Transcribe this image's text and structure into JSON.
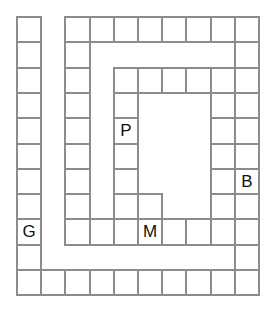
{
  "board": {
    "title": "Spiral path game board",
    "origin": [
      16,
      16
    ],
    "cell_size": [
      24.2,
      25.3
    ],
    "columns": 10,
    "rows": 11,
    "line_color": "#8c8c8c",
    "cells": [
      {
        "col": 0,
        "row": 0
      },
      {
        "col": 0,
        "row": 1
      },
      {
        "col": 0,
        "row": 2
      },
      {
        "col": 0,
        "row": 3
      },
      {
        "col": 0,
        "row": 4
      },
      {
        "col": 0,
        "row": 5
      },
      {
        "col": 0,
        "row": 6
      },
      {
        "col": 0,
        "row": 7
      },
      {
        "col": 0,
        "row": 8,
        "label": "G"
      },
      {
        "col": 0,
        "row": 9
      },
      {
        "col": 0,
        "row": 10
      },
      {
        "col": 1,
        "row": 10
      },
      {
        "col": 2,
        "row": 10
      },
      {
        "col": 3,
        "row": 10
      },
      {
        "col": 4,
        "row": 10
      },
      {
        "col": 5,
        "row": 10
      },
      {
        "col": 6,
        "row": 10
      },
      {
        "col": 7,
        "row": 10
      },
      {
        "col": 8,
        "row": 10
      },
      {
        "col": 9,
        "row": 10
      },
      {
        "col": 9,
        "row": 9
      },
      {
        "col": 9,
        "row": 8
      },
      {
        "col": 9,
        "row": 7
      },
      {
        "col": 9,
        "row": 6,
        "label": "B"
      },
      {
        "col": 9,
        "row": 5
      },
      {
        "col": 9,
        "row": 4
      },
      {
        "col": 9,
        "row": 3
      },
      {
        "col": 9,
        "row": 2
      },
      {
        "col": 9,
        "row": 1
      },
      {
        "col": 9,
        "row": 0
      },
      {
        "col": 8,
        "row": 0
      },
      {
        "col": 7,
        "row": 0
      },
      {
        "col": 6,
        "row": 0
      },
      {
        "col": 5,
        "row": 0
      },
      {
        "col": 4,
        "row": 0
      },
      {
        "col": 3,
        "row": 0
      },
      {
        "col": 2,
        "row": 0
      },
      {
        "col": 2,
        "row": 1
      },
      {
        "col": 2,
        "row": 2
      },
      {
        "col": 2,
        "row": 3
      },
      {
        "col": 2,
        "row": 4
      },
      {
        "col": 2,
        "row": 5
      },
      {
        "col": 2,
        "row": 6
      },
      {
        "col": 2,
        "row": 7
      },
      {
        "col": 2,
        "row": 8
      },
      {
        "col": 3,
        "row": 8
      },
      {
        "col": 4,
        "row": 8
      },
      {
        "col": 5,
        "row": 8,
        "label": "M"
      },
      {
        "col": 6,
        "row": 8
      },
      {
        "col": 7,
        "row": 8
      },
      {
        "col": 8,
        "row": 8
      },
      {
        "col": 8,
        "row": 7
      },
      {
        "col": 8,
        "row": 6
      },
      {
        "col": 8,
        "row": 5
      },
      {
        "col": 8,
        "row": 4
      },
      {
        "col": 8,
        "row": 3
      },
      {
        "col": 8,
        "row": 2
      },
      {
        "col": 7,
        "row": 2
      },
      {
        "col": 6,
        "row": 2
      },
      {
        "col": 5,
        "row": 2
      },
      {
        "col": 4,
        "row": 2
      },
      {
        "col": 4,
        "row": 3
      },
      {
        "col": 4,
        "row": 4,
        "label": "P"
      },
      {
        "col": 4,
        "row": 5
      },
      {
        "col": 4,
        "row": 6
      },
      {
        "col": 4,
        "row": 7
      },
      {
        "col": 5,
        "row": 7
      }
    ]
  },
  "labels": {
    "G": "G",
    "B": "B",
    "M": "M",
    "P": "P"
  }
}
